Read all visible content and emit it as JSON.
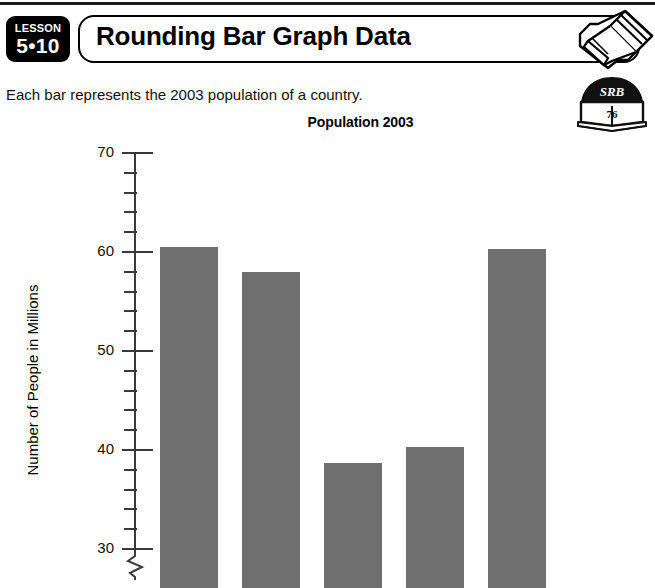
{
  "page": {
    "lesson_word": "LESSON",
    "lesson_number": "5•10",
    "title": "Rounding Bar Graph Data",
    "intro": "Each bar represents the 2003 population of a country.",
    "pencil_icon_name": "pencil-icon",
    "srb_label": "SRB",
    "srb_page": "76"
  },
  "chart_data": {
    "type": "bar",
    "title": "Population 2003",
    "xlabel": "",
    "ylabel": "Number of People in Millions",
    "categories": [
      "Bar 1",
      "Bar 2",
      "Bar 3",
      "Bar 4",
      "Bar 5"
    ],
    "values": [
      60.5,
      58.0,
      38.7,
      40.3,
      60.3
    ],
    "ylim": [
      30,
      70
    ],
    "y_major_ticks": [
      70,
      60,
      50,
      40,
      30
    ],
    "y_minor_tick_step": 2,
    "axis_break": true,
    "axis_break_below": 30,
    "grid": false,
    "legend": null,
    "bar_color": "#6f6f6f",
    "axis_color": "#3a3a3a",
    "note": "Bars are cut off at the bottom edge of the visible screenshot; x-axis category labels are not visible."
  }
}
